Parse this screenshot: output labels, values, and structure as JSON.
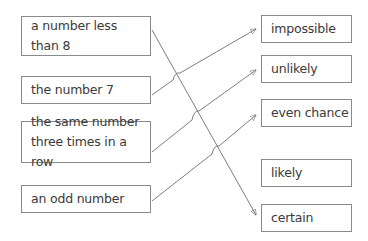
{
  "diagram": {
    "type": "matching-exercise",
    "left_items": [
      {
        "id": "a",
        "label": "a number less than 8",
        "lines": [
          "a number less",
          "than 8"
        ]
      },
      {
        "id": "b",
        "label": "the number 7",
        "lines": [
          "the number 7"
        ]
      },
      {
        "id": "c",
        "label": "the same number three times in a row",
        "lines": [
          "the same number",
          "three times in a row"
        ]
      },
      {
        "id": "d",
        "label": "an odd number",
        "lines": [
          "an odd number"
        ]
      }
    ],
    "right_items": [
      {
        "id": "impossible",
        "label": "impossible"
      },
      {
        "id": "unlikely",
        "label": "unlikely"
      },
      {
        "id": "even_chance",
        "label": "even chance"
      },
      {
        "id": "likely",
        "label": "likely"
      },
      {
        "id": "certain",
        "label": "certain"
      }
    ],
    "connections": [
      {
        "from": "a number less than 8",
        "to": "certain"
      },
      {
        "from": "the number 7",
        "to": "impossible"
      },
      {
        "from": "the same number three times in a row",
        "to": "unlikely"
      },
      {
        "from": "an odd number",
        "to": "even chance"
      }
    ],
    "colors": {
      "box_border": "#8a8a8a",
      "line": "#6e6e6e",
      "text": "#3a3a3a",
      "background": "#ffffff"
    }
  }
}
